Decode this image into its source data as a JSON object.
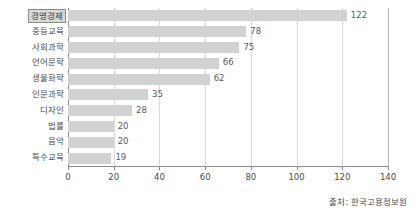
{
  "chart_data": {
    "type": "bar",
    "orientation": "horizontal",
    "title": "",
    "subtitle": "",
    "xlabel": "",
    "ylabel": "",
    "categories": [
      "경영경제",
      "중등교육",
      "사회과학",
      "언어문학",
      "생물화학",
      "인문과학",
      "디자인",
      "법률",
      "음악",
      "특수교육"
    ],
    "values": [
      122,
      78,
      75,
      66,
      62,
      35,
      28,
      20,
      20,
      19
    ],
    "xlim": [
      0,
      140
    ],
    "xticks": [
      0,
      20,
      40,
      60,
      80,
      100,
      120,
      140
    ],
    "xtick_labels": [
      "0",
      "20",
      "40",
      "60",
      "80",
      "100",
      "120",
      "140"
    ],
    "grid": true,
    "grid_axis": "x",
    "legend": null,
    "data_labels": [
      "122",
      "78",
      "75",
      "66",
      "62",
      "35",
      "28",
      "20",
      "20",
      "19"
    ],
    "highlighted_category": "경영경제",
    "bar_color": "#d2d2d2",
    "axis_color": "#8d8d8d",
    "grid_color": "#d9d9d9",
    "text_color": "#4a4a4a"
  },
  "annotations": {
    "source": "출처: 한국고용정보원"
  }
}
